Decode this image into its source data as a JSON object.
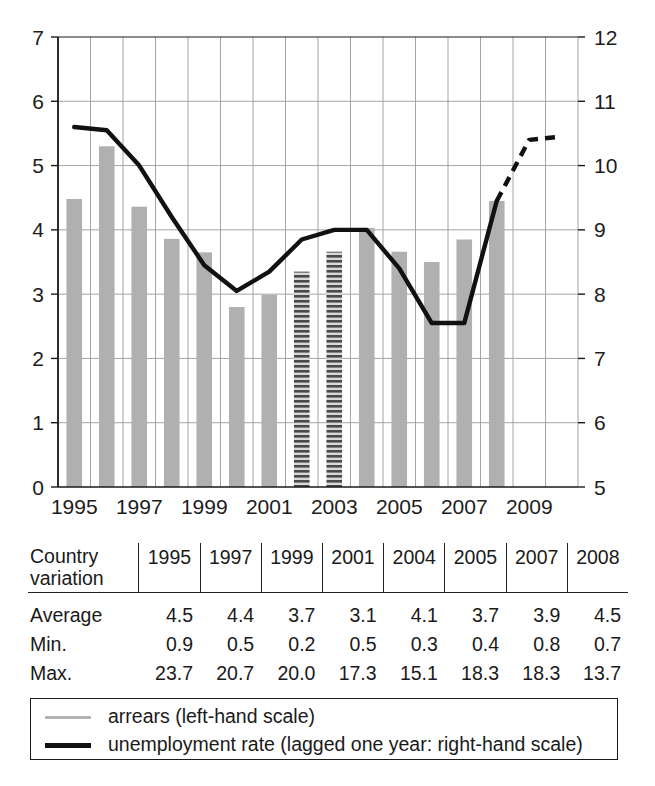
{
  "chart_data": {
    "type": "bar",
    "title": "",
    "xlabel": "",
    "ylabel": "",
    "grid": true,
    "legend_position": "bottom",
    "x_tick_labels": [
      "1995",
      "1997",
      "1999",
      "2001",
      "2003",
      "2005",
      "2007",
      "2009"
    ],
    "x_tick_years": [
      1995,
      1997,
      1999,
      2001,
      2003,
      2005,
      2007,
      2009
    ],
    "left_axis": {
      "name": "arrears (left-hand scale)",
      "ylim": [
        0,
        7
      ],
      "ticks": [
        0,
        1,
        2,
        3,
        4,
        5,
        6,
        7
      ],
      "tick_labels": [
        "0",
        "1",
        "2",
        "3",
        "4",
        "5",
        "6",
        "7"
      ]
    },
    "right_axis": {
      "name": "unemployment rate (right-hand scale)",
      "ylim": [
        5,
        12
      ],
      "ticks": [
        5,
        6,
        7,
        8,
        9,
        10,
        11,
        12
      ],
      "tick_labels": [
        "5",
        "6",
        "7",
        "8",
        "9",
        "10",
        "11",
        "12"
      ]
    },
    "series": [
      {
        "name": "arrears (left-hand scale)",
        "type": "bar",
        "axis": "left",
        "color": "#b0b0b0",
        "x": [
          1995,
          1996,
          1997,
          1998,
          1999,
          2000,
          2001,
          2002,
          2003,
          2004,
          2005,
          2006,
          2007,
          2008
        ],
        "values": [
          4.48,
          5.3,
          4.36,
          3.86,
          3.65,
          2.8,
          2.99,
          3.35,
          3.66,
          4.03,
          3.66,
          3.5,
          3.85,
          4.45
        ],
        "hatched_points": [
          2002,
          2003
        ],
        "hatch_style": "horizontal-lines"
      },
      {
        "name": "unemployment rate (lagged one year: right-hand scale)",
        "type": "line",
        "axis": "right",
        "color": "#111111",
        "x": [
          1995,
          1996,
          1997,
          1998,
          1999,
          2000,
          2001,
          2002,
          2003,
          2004,
          2005,
          2006,
          2007,
          2008,
          2009,
          2010
        ],
        "values": [
          10.6,
          10.55,
          10.0,
          9.2,
          8.45,
          8.05,
          8.35,
          8.85,
          9.0,
          9.0,
          8.4,
          7.55,
          7.55,
          9.45,
          10.4,
          10.45
        ],
        "solid_until": 2008,
        "dashed_from": 2008
      }
    ]
  },
  "legend": {
    "items": [
      {
        "swatch": "bar-swatch",
        "label": "arrears (left-hand scale)"
      },
      {
        "swatch": "line-swatch",
        "label": "unemployment rate (lagged one year: right-hand scale)"
      }
    ]
  },
  "table": {
    "corner_label_line1": "Country",
    "corner_label_line2": "variation",
    "columns": [
      "1995",
      "1997",
      "1999",
      "2001",
      "2004",
      "2005",
      "2007",
      "2008"
    ],
    "rows": [
      {
        "label": "Average",
        "values": [
          "4.5",
          "4.4",
          "3.7",
          "3.1",
          "4.1",
          "3.7",
          "3.9",
          "4.5"
        ]
      },
      {
        "label": "Min.",
        "values": [
          "0.9",
          "0.5",
          "0.2",
          "0.5",
          "0.3",
          "0.4",
          "0.8",
          "0.7"
        ]
      },
      {
        "label": "Max.",
        "values": [
          "23.7",
          "20.7",
          "20.0",
          "17.3",
          "15.1",
          "18.3",
          "18.3",
          "13.7"
        ]
      }
    ]
  },
  "colors": {
    "bar_fill": "#b0b0b0",
    "hatch_dark": "#4a4a4a",
    "line": "#111111",
    "grid": "#9a9aa0",
    "axis": "#1a1a1a",
    "text": "#1a1a1a"
  }
}
